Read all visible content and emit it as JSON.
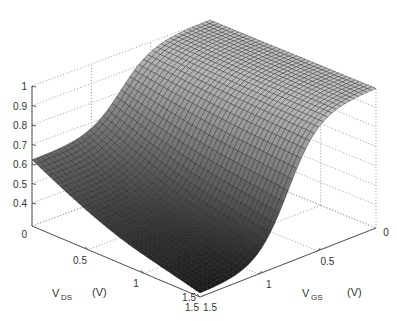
{
  "chart_data": {
    "type": "surface",
    "title": "",
    "xlabel": {
      "main": "V",
      "sub": "DS",
      "unit": "(V)"
    },
    "ylabel": {
      "main": "V",
      "sub": "GS",
      "unit": "(V)"
    },
    "zlabel": "",
    "xlim": [
      0,
      1.5
    ],
    "ylim": [
      0,
      1.5
    ],
    "zlim": [
      0,
      1
    ],
    "x_ticks": [
      "0",
      "0.5",
      "1",
      "1.5"
    ],
    "y_ticks": [
      "0",
      "0.5",
      "1",
      "1.5"
    ],
    "z_ticks": [
      "0",
      "0.4",
      "0.5",
      "0.6",
      "0.7",
      "0.8",
      "0.9",
      "1"
    ],
    "grid": true,
    "colormap": "gray",
    "surface_description": "z rises sigmoidally with V_GS from ~0.3 at V_GS=1.5 to ~1.0 plateau at low V_GS; weak dependence on V_DS",
    "sample_points": [
      {
        "vds": 0.0,
        "vgs": 1.5,
        "z": 0.6
      },
      {
        "vds": 1.5,
        "vgs": 1.5,
        "z": 0.3
      },
      {
        "vds": 0.0,
        "vgs": 0.0,
        "z": 1.0
      },
      {
        "vds": 1.5,
        "vgs": 0.0,
        "z": 1.0
      },
      {
        "vds": 0.75,
        "vgs": 0.75,
        "z": 0.75
      }
    ]
  }
}
